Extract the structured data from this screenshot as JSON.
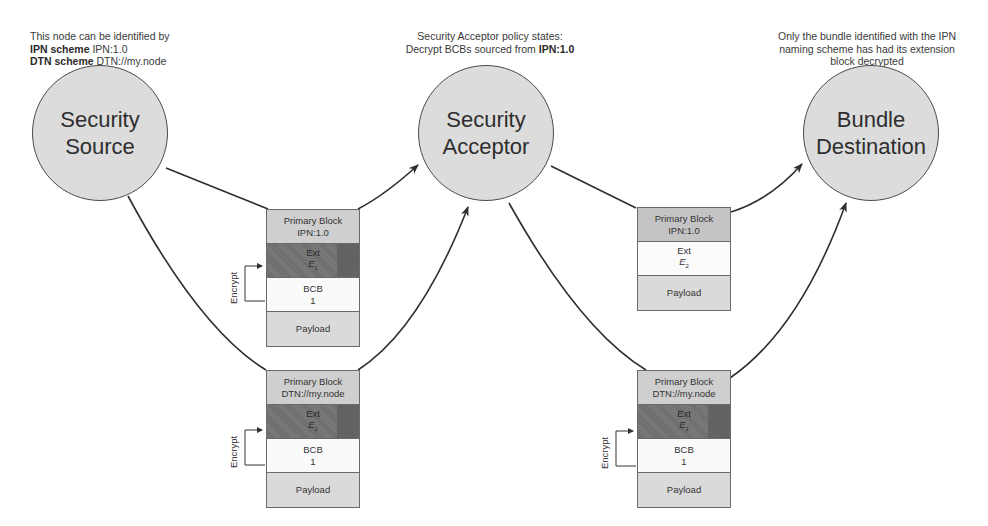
{
  "notes": {
    "source": {
      "line1": "This node can be identified by",
      "ipn_label": "IPN scheme",
      "ipn_value": " IPN:1.0",
      "dtn_label": "DTN scheme",
      "dtn_value": " DTN://my.node"
    },
    "acceptor": {
      "line1": "Security Acceptor policy states:",
      "line2": "Decrypt BCBs sourced from ",
      "line2_bold": "IPN:1.0"
    },
    "destination": {
      "line1": "Only the bundle identified with the IPN",
      "line2": "naming scheme has had its extension",
      "line3": "block decrypted"
    }
  },
  "nodes": {
    "source": {
      "line1": "Security",
      "line2": "Source"
    },
    "acceptor": {
      "line1": "Security",
      "line2": "Acceptor"
    },
    "destination": {
      "line1": "Bundle",
      "line2": "Destination"
    }
  },
  "bundles": {
    "src_ipn": {
      "primary_title": "Primary Block",
      "primary_id": "IPN:1.0",
      "ext_title": "Ext",
      "ext_sym": "E",
      "ext_sub": "1",
      "bcb_title": "BCB",
      "bcb_num": "1",
      "payload": "Payload",
      "encrypt_label": "Encrypt"
    },
    "src_dtn": {
      "primary_title": "Primary Block",
      "primary_id": "DTN://my.node",
      "ext_title": "Ext",
      "ext_sym": "E",
      "ext_sub": "1",
      "bcb_title": "BCB",
      "bcb_num": "1",
      "payload": "Payload",
      "encrypt_label": "Encrypt"
    },
    "acc_ipn": {
      "primary_title": "Primary Block",
      "primary_id": "IPN:1.0",
      "ext_title": "Ext",
      "ext_sym": "E",
      "ext_sub": "2",
      "payload": "Payload"
    },
    "acc_dtn": {
      "primary_title": "Primary Block",
      "primary_id": "DTN://my.node",
      "ext_title": "Ext",
      "ext_sym": "E",
      "ext_sub": "1",
      "bcb_title": "BCB",
      "bcb_num": "1",
      "payload": "Payload",
      "encrypt_label": "Encrypt"
    }
  },
  "colors": {
    "node_fill": "#dcdcdc",
    "stroke": "#333333",
    "encrypted_ext": "#707070"
  }
}
